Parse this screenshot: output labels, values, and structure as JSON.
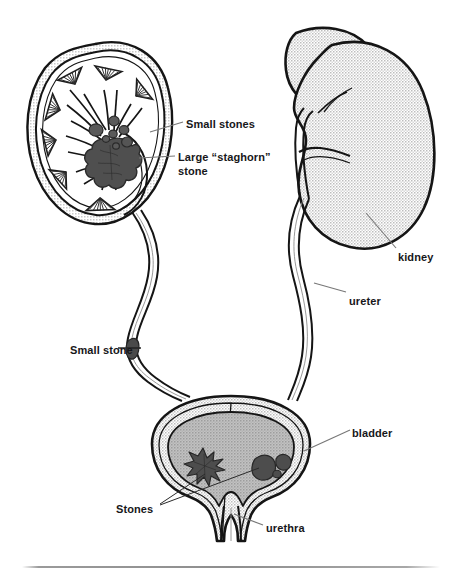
{
  "figure": {
    "type": "medical-anatomical-illustration",
    "background_color": "#ffffff",
    "line_color": "#1a1a1a",
    "label_color": "#17171a",
    "organ_fill_color": "#c9c9c9",
    "bladder_interior_color": "#ababab",
    "stone_color": "#4a4a4a",
    "leader_line_color": "#6b6b6b"
  },
  "labels": [
    {
      "id": "small-stones",
      "text": "Small stones",
      "x": 186,
      "y": 118,
      "align": "left"
    },
    {
      "id": "large-staghorn",
      "text": "Large “staghorn”\nstone",
      "x": 178,
      "y": 151,
      "align": "left"
    },
    {
      "id": "kidney",
      "text": "kidney",
      "x": 398,
      "y": 251,
      "align": "left"
    },
    {
      "id": "ureter",
      "text": "ureter",
      "x": 349,
      "y": 295,
      "align": "left"
    },
    {
      "id": "small-stone",
      "text": "Small stone",
      "x": 70,
      "y": 344,
      "align": "left"
    },
    {
      "id": "bladder",
      "text": "bladder",
      "x": 352,
      "y": 427,
      "align": "left"
    },
    {
      "id": "stones",
      "text": "Stones",
      "x": 116,
      "y": 503,
      "align": "left"
    },
    {
      "id": "urethra",
      "text": "urethra",
      "x": 266,
      "y": 522,
      "align": "left"
    }
  ],
  "structures": {
    "left_kidney_section": {
      "name": "kidney cross-section",
      "contents": [
        "renal capsule",
        "renal cortex",
        "renal pyramids",
        "calyces",
        "renal pelvis",
        "small stones",
        "large staghorn stone"
      ]
    },
    "right_kidney": {
      "name": "kidney",
      "view": "whole organ"
    },
    "ureters": {
      "count": 2,
      "left_contains_stone": true
    },
    "bladder": {
      "name": "bladder",
      "stones": [
        "star-shaped stone",
        "two rounded stones"
      ]
    },
    "urethra": {
      "name": "urethra"
    }
  }
}
